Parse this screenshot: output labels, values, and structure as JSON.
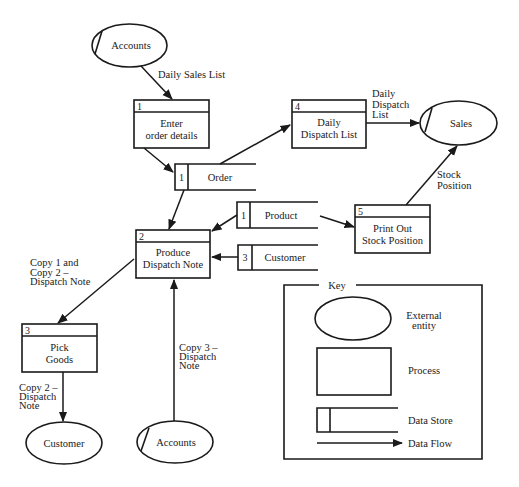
{
  "diagram": {
    "type": "data-flow-diagram",
    "external_entities": [
      {
        "id": "ee-accounts-top",
        "label": "Accounts",
        "duplicate_mark": true
      },
      {
        "id": "ee-sales",
        "label": "Sales",
        "duplicate_mark": true
      },
      {
        "id": "ee-customer",
        "label": "Customer",
        "duplicate_mark": false
      },
      {
        "id": "ee-accounts-bottom",
        "label": "Accounts",
        "duplicate_mark": true
      }
    ],
    "processes": [
      {
        "number": "1",
        "line1": "Enter",
        "line2": "order details"
      },
      {
        "number": "2",
        "line1": "Produce",
        "line2": "Dispatch Note"
      },
      {
        "number": "3",
        "line1": "Pick",
        "line2": "Goods"
      },
      {
        "number": "4",
        "line1": "Daily",
        "line2": "Dispatch List"
      },
      {
        "number": "5",
        "line1": "Print Out",
        "line2": "Stock Position"
      }
    ],
    "data_stores": [
      {
        "number": "1",
        "label": "Order"
      },
      {
        "number": "1",
        "label": "Product"
      },
      {
        "number": "3",
        "label": "Customer"
      }
    ],
    "flows": [
      {
        "from": "Accounts",
        "to": "Process 1",
        "label_lines": [
          "Daily Sales List"
        ]
      },
      {
        "from": "Process 1",
        "to": "Order",
        "label_lines": []
      },
      {
        "from": "Order",
        "to": "Process 4",
        "label_lines": []
      },
      {
        "from": "Process 4",
        "to": "Sales",
        "label_lines": [
          "Daily",
          "Dispatch",
          "List"
        ]
      },
      {
        "from": "Order",
        "to": "Process 2",
        "label_lines": []
      },
      {
        "from": "Product",
        "to": "Process 2",
        "label_lines": []
      },
      {
        "from": "Product",
        "to": "Process 5",
        "label_lines": []
      },
      {
        "from": "Process 5",
        "to": "Sales",
        "label_lines": [
          "Stock",
          "Position"
        ]
      },
      {
        "from": "Customer store",
        "to": "Process 2",
        "label_lines": []
      },
      {
        "from": "Process 2",
        "to": "Process 3",
        "label_lines": [
          "Copy 1 and",
          "Copy 2 –",
          "Dispatch Note"
        ]
      },
      {
        "from": "Process 3",
        "to": "Customer",
        "label_lines": [
          "Copy 2 –",
          "Dispatch",
          "Note"
        ]
      },
      {
        "from": "Accounts",
        "to": "Process 2",
        "label_lines": [
          "Copy 3 –",
          "Dispatch",
          "Note"
        ]
      }
    ]
  },
  "key": {
    "title": "Key",
    "external_entity": [
      "External",
      "entity"
    ],
    "process": "Process",
    "data_store": "Data Store",
    "data_flow": "Data Flow"
  }
}
